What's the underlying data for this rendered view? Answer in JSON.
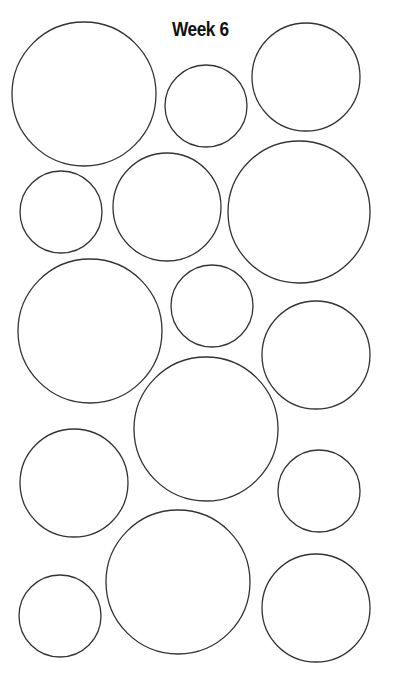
{
  "title": "Week 6",
  "stroke_color": "#333333",
  "fill_color": "#ffffff",
  "circles": [
    {
      "cx": 84,
      "cy": 94,
      "r": 72
    },
    {
      "cx": 206,
      "cy": 106,
      "r": 41
    },
    {
      "cx": 306,
      "cy": 77,
      "r": 54
    },
    {
      "cx": 61,
      "cy": 212,
      "r": 41
    },
    {
      "cx": 167,
      "cy": 207,
      "r": 54
    },
    {
      "cx": 299,
      "cy": 212,
      "r": 71
    },
    {
      "cx": 90,
      "cy": 331,
      "r": 72
    },
    {
      "cx": 212,
      "cy": 306,
      "r": 41
    },
    {
      "cx": 316,
      "cy": 355,
      "r": 54
    },
    {
      "cx": 206,
      "cy": 429,
      "r": 72
    },
    {
      "cx": 74,
      "cy": 483,
      "r": 54
    },
    {
      "cx": 319,
      "cy": 491,
      "r": 41
    },
    {
      "cx": 178,
      "cy": 582,
      "r": 72
    },
    {
      "cx": 60,
      "cy": 616,
      "r": 41
    },
    {
      "cx": 316,
      "cy": 608,
      "r": 54
    }
  ]
}
